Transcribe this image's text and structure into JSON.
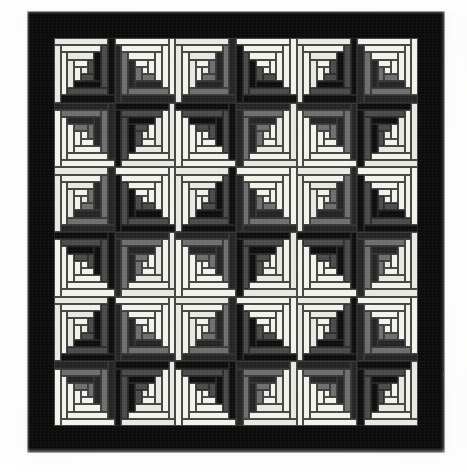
{
  "image": {
    "subject": "log-cabin-quilt",
    "caption": "",
    "background_color": "#fbfbf9"
  },
  "quilt": {
    "name": "Log Cabin Quilt",
    "setting": "Barn Raising / Sunshine and Shadow",
    "border_color": "#0b0b0b",
    "border_width_px": 26,
    "grid": {
      "rows": 6,
      "cols": 6
    },
    "frame": {
      "x": 28,
      "y": 12,
      "width": 416,
      "height": 440
    },
    "field": {
      "x": 26,
      "y": 26,
      "width": 364,
      "height": 388
    },
    "block": {
      "width": 60.7,
      "height": 64.7,
      "logs_per_side": 4,
      "center_size": 13
    },
    "palette": {
      "light": "#f2f1ea",
      "light_alt": "#e9e8e0",
      "medium": "#6e6e6e",
      "medium_dark": "#4a4a4a",
      "dark": "#242424",
      "darkest": "#0d0d0d",
      "background": "#fbfbf9"
    },
    "legend": [
      {
        "swatch": "light",
        "label": "Light (cream/white) logs"
      },
      {
        "swatch": "medium",
        "label": "Medium gray logs"
      },
      {
        "swatch": "dark",
        "label": "Dark (charcoal/black) logs"
      }
    ],
    "block_orientations": [
      [
        "NW",
        "NE",
        "NW",
        "NE",
        "NW",
        "NE"
      ],
      [
        "SW",
        "SE",
        "SW",
        "SE",
        "SW",
        "SE"
      ],
      [
        "NW",
        "NE",
        "NW",
        "NE",
        "NW",
        "NE"
      ],
      [
        "SW",
        "SE",
        "SW",
        "SE",
        "SW",
        "SE"
      ],
      [
        "NW",
        "NE",
        "NW",
        "NE",
        "NW",
        "NE"
      ],
      [
        "SW",
        "SE",
        "SW",
        "SE",
        "SW",
        "SE"
      ]
    ],
    "light_shade_map": [
      [
        0,
        1,
        0,
        1,
        0,
        1
      ],
      [
        1,
        0,
        1,
        0,
        1,
        0
      ],
      [
        0,
        1,
        0,
        1,
        0,
        1
      ],
      [
        1,
        0,
        1,
        0,
        1,
        0
      ],
      [
        0,
        1,
        0,
        1,
        0,
        1
      ],
      [
        1,
        0,
        1,
        0,
        1,
        0
      ]
    ],
    "dark_shade_map": [
      [
        0,
        1,
        1,
        0,
        0,
        1
      ],
      [
        1,
        0,
        0,
        1,
        1,
        0
      ],
      [
        1,
        0,
        0,
        1,
        1,
        0
      ],
      [
        0,
        1,
        1,
        0,
        0,
        1
      ],
      [
        0,
        1,
        1,
        0,
        0,
        1
      ],
      [
        1,
        0,
        0,
        1,
        1,
        0
      ]
    ]
  },
  "chart_data": {
    "type": "heatmap",
    "xlabel": "column",
    "ylabel": "row",
    "categories": [
      "1",
      "2",
      "3",
      "4",
      "5",
      "6"
    ],
    "rows": [
      "1",
      "2",
      "3",
      "4",
      "5",
      "6"
    ],
    "legend": [
      "NW",
      "NE",
      "SW",
      "SE"
    ],
    "values": [
      [
        "NW",
        "NE",
        "NW",
        "NE",
        "NW",
        "NE"
      ],
      [
        "SW",
        "SE",
        "SW",
        "SE",
        "SW",
        "SE"
      ],
      [
        "NW",
        "NE",
        "NW",
        "NE",
        "NW",
        "NE"
      ],
      [
        "SW",
        "SE",
        "SW",
        "SE",
        "SW",
        "SE"
      ],
      [
        "NW",
        "NE",
        "NW",
        "NE",
        "NW",
        "NE"
      ],
      [
        "SW",
        "SE",
        "SW",
        "SE",
        "SW",
        "SE"
      ]
    ]
  }
}
